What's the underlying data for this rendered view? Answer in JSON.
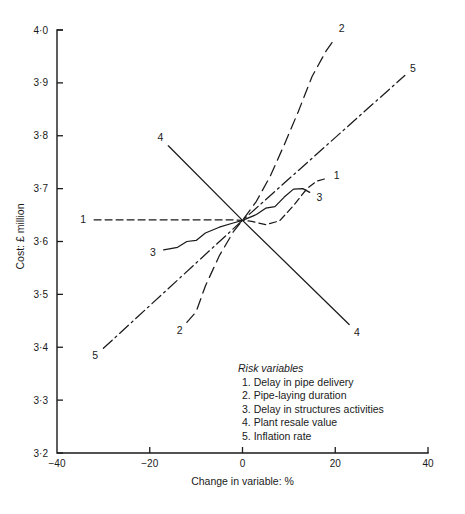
{
  "chart_data": {
    "type": "line",
    "title": "",
    "xlabel": "Change in variable: %",
    "ylabel": "Cost: £ million",
    "xlim": [
      -40,
      40
    ],
    "ylim": [
      3.2,
      4.0
    ],
    "xticks": [
      "-40",
      "-20",
      "0",
      "20",
      "40"
    ],
    "xtick_values": [
      -40,
      -20,
      0,
      20,
      40
    ],
    "yticks": [
      "4·0",
      "3·9",
      "3·8",
      "3·7",
      "3·6",
      "3·5",
      "3·4",
      "3·3",
      "3·2"
    ],
    "ytick_values": [
      4.0,
      3.9,
      3.8,
      3.7,
      3.6,
      3.5,
      3.4,
      3.3,
      3.2
    ],
    "grid": false,
    "legend_position": "inside-lower-right",
    "base_point": {
      "x": 0,
      "y": 3.64
    },
    "series": [
      {
        "name": "1",
        "label": "Delay in pipe delivery",
        "style": "dashed",
        "end_labels": [
          "1",
          "1"
        ],
        "points": [
          [
            -32,
            3.641
          ],
          [
            -20,
            3.641
          ],
          [
            -10,
            3.641
          ],
          [
            -2,
            3.641
          ],
          [
            0,
            3.64
          ],
          [
            2,
            3.638
          ],
          [
            5,
            3.632
          ],
          [
            8,
            3.639
          ],
          [
            11,
            3.668
          ],
          [
            14,
            3.701
          ],
          [
            16,
            3.714
          ],
          [
            18,
            3.719
          ]
        ]
      },
      {
        "name": "2",
        "label": "Pipe-laying duration",
        "style": "long-dashed",
        "end_labels": [
          "2",
          "2"
        ],
        "points": [
          [
            -12,
            3.447
          ],
          [
            -10,
            3.467
          ],
          [
            -8,
            3.516
          ],
          [
            -5,
            3.573
          ],
          [
            -2,
            3.618
          ],
          [
            0,
            3.64
          ],
          [
            3,
            3.676
          ],
          [
            6,
            3.724
          ],
          [
            9,
            3.783
          ],
          [
            12,
            3.845
          ],
          [
            15,
            3.912
          ],
          [
            18,
            3.96
          ],
          [
            20,
            3.985
          ]
        ]
      },
      {
        "name": "3",
        "label": "Delay in structures activities",
        "style": "solid",
        "end_labels": [
          "3",
          "3"
        ],
        "points": [
          [
            -17,
            3.584
          ],
          [
            -14,
            3.589
          ],
          [
            -12,
            3.6
          ],
          [
            -10,
            3.602
          ],
          [
            -8,
            3.616
          ],
          [
            -5,
            3.627
          ],
          [
            -2,
            3.635
          ],
          [
            0,
            3.64
          ],
          [
            3,
            3.651
          ],
          [
            5,
            3.663
          ],
          [
            7,
            3.666
          ],
          [
            9,
            3.684
          ],
          [
            11,
            3.699
          ],
          [
            13,
            3.7
          ],
          [
            14.5,
            3.693
          ]
        ]
      },
      {
        "name": "4",
        "label": "Plant resale value",
        "style": "solid",
        "end_labels": [
          "4",
          "4"
        ],
        "points": [
          [
            -16,
            3.781
          ],
          [
            0,
            3.64
          ],
          [
            23,
            3.443
          ]
        ]
      },
      {
        "name": "5",
        "label": "Inflation rate",
        "style": "dash-dot",
        "end_labels": [
          "5",
          "5"
        ],
        "points": [
          [
            -30,
            3.398
          ],
          [
            0,
            3.64
          ],
          [
            35,
            3.914
          ]
        ]
      }
    ]
  },
  "legend": {
    "title": "Risk variables",
    "items": [
      "1. Delay in pipe delivery",
      "2. Pipe-laying duration",
      "3. Delay in structures activities",
      "4. Plant resale value",
      "5. Inflation rate"
    ]
  }
}
